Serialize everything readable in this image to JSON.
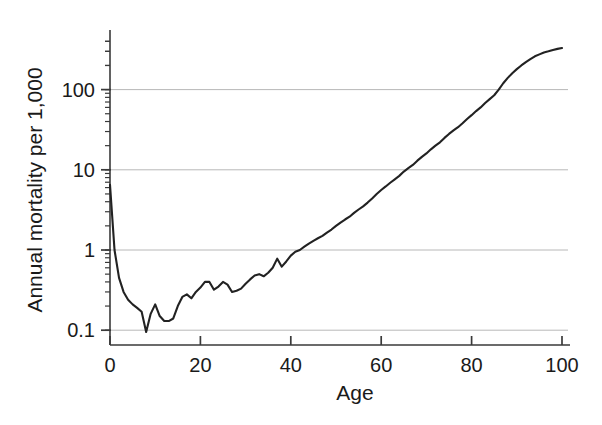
{
  "chart_data": {
    "type": "line",
    "title": "",
    "xlabel": "Age",
    "ylabel": "Annual mortality per 1,000",
    "xlim": [
      0,
      100
    ],
    "ylim": [
      0.07,
      500
    ],
    "yscale": "log",
    "xscale": "linear",
    "grid": "horizontal-major-only",
    "legend": "none",
    "xticks": [
      0,
      20,
      40,
      60,
      80,
      100
    ],
    "xtick_labels": [
      "0",
      "20",
      "40",
      "60",
      "80",
      "100"
    ],
    "yticks": [
      0.1,
      1,
      10,
      100
    ],
    "ytick_labels": [
      "0.1",
      "1",
      "10",
      "100"
    ],
    "yminor_ticks": [
      0.1,
      0.2,
      0.3,
      0.4,
      0.5,
      0.6,
      0.7,
      0.8,
      0.9,
      1,
      2,
      3,
      4,
      5,
      6,
      7,
      8,
      9,
      10,
      20,
      30,
      40,
      50,
      60,
      70,
      80,
      90,
      100,
      200,
      300,
      400
    ],
    "line_color": "#222222",
    "grid_color": "#b8b8b8",
    "axis_color": "#3a3a3a",
    "series": [
      {
        "name": "Annual mortality per 1,000",
        "x": [
          0,
          1,
          2,
          3,
          4,
          5,
          6,
          7,
          8,
          9,
          10,
          11,
          12,
          13,
          14,
          15,
          16,
          17,
          18,
          19,
          20,
          21,
          22,
          23,
          24,
          25,
          26,
          27,
          28,
          29,
          30,
          31,
          32,
          33,
          34,
          35,
          36,
          37,
          38,
          39,
          40,
          41,
          42,
          43,
          44,
          45,
          46,
          47,
          48,
          49,
          50,
          51,
          52,
          53,
          54,
          55,
          56,
          57,
          58,
          59,
          60,
          61,
          62,
          63,
          64,
          65,
          66,
          67,
          68,
          69,
          70,
          71,
          72,
          73,
          74,
          75,
          76,
          77,
          78,
          79,
          80,
          81,
          82,
          83,
          84,
          85,
          86,
          87,
          88,
          89,
          90,
          91,
          92,
          93,
          94,
          95,
          96,
          97,
          98,
          99,
          100
        ],
        "y": [
          6.5,
          1.0,
          0.45,
          0.3,
          0.24,
          0.21,
          0.19,
          0.17,
          0.095,
          0.16,
          0.21,
          0.15,
          0.13,
          0.13,
          0.14,
          0.2,
          0.26,
          0.28,
          0.25,
          0.3,
          0.34,
          0.4,
          0.4,
          0.32,
          0.35,
          0.4,
          0.37,
          0.3,
          0.31,
          0.33,
          0.38,
          0.43,
          0.48,
          0.5,
          0.47,
          0.52,
          0.6,
          0.78,
          0.62,
          0.72,
          0.85,
          0.95,
          1.0,
          1.1,
          1.2,
          1.3,
          1.4,
          1.5,
          1.65,
          1.8,
          2.0,
          2.2,
          2.4,
          2.6,
          2.9,
          3.2,
          3.5,
          3.9,
          4.4,
          5.0,
          5.6,
          6.2,
          6.9,
          7.6,
          8.4,
          9.5,
          10.5,
          11.5,
          13.0,
          14.5,
          16.0,
          18.0,
          20.0,
          22.0,
          25.0,
          28.0,
          31.0,
          34.0,
          38.0,
          43.0,
          48.0,
          54.0,
          60.0,
          68.0,
          76.0,
          85.0,
          100.0,
          120.0,
          140.0,
          160.0,
          180.0,
          200.0,
          220.0,
          240.0,
          260.0,
          275.0,
          290.0,
          300.0,
          312.0,
          322.0,
          330.0
        ]
      }
    ]
  },
  "axes": {
    "x_axis_title": "Age",
    "y_axis_title": "Annual mortality per 1,000"
  }
}
